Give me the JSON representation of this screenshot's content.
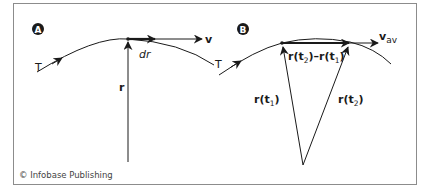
{
  "figure": {
    "credit": "© Infobase Publishing",
    "border_color": "#8c8c8c",
    "line_color": "#1a1a1a",
    "panels": [
      {
        "id": "A",
        "badge": "A",
        "labels": {
          "trajectory": "T",
          "velocity": "v",
          "displacement": "dr",
          "position": "r"
        }
      },
      {
        "id": "B",
        "badge": "B",
        "labels": {
          "trajectory": "T",
          "velocity": "v",
          "velocity_sub": "av",
          "difference_a": "r(t",
          "difference_a_sub": "2",
          "difference_mid": ")–r(t",
          "difference_b_sub": "1",
          "difference_end": ")",
          "position_1": "r(t",
          "position_1_sub": "1",
          "position_1_end": ")",
          "position_2": "r(t",
          "position_2_sub": "2",
          "position_2_end": ")"
        }
      }
    ]
  }
}
